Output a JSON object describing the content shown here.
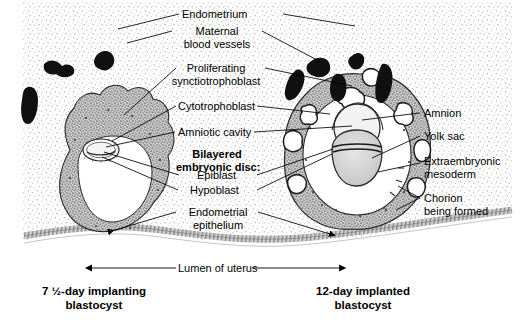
{
  "figure": {
    "title_implied": "Implantation of the blastocyst in the endometrium",
    "background_color": "#ffffff",
    "ink_color": "#000000",
    "stipple_color": "#8c8c8c",
    "trophoblast_fill": "#a8a8a8",
    "vessel_color": "#101010",
    "cavity_fill": "#ffffff",
    "yolk_sac_fill": "#d2d2d2",
    "epithelium_fill": "#b4b4b4"
  },
  "labels": {
    "endometrium": "Endometrium",
    "maternal_blood_vessels_l1": "Maternal",
    "maternal_blood_vessels_l2": "blood vessels",
    "proliferating_l1": "Proliferating",
    "proliferating_l2": "synctiotrophoblast",
    "cytotrophoblast": "Cytotrophoblast",
    "amniotic_cavity": "Amniotic cavity",
    "bilayered_disc_l1": "Bilayered",
    "bilayered_disc_l2": "embryonic disc:",
    "epiblast": "Epiblast",
    "hypoblast": "Hypoblast",
    "endometrial_epithelium_l1": "Endometrial",
    "endometrial_epithelium_l2": "epithelium",
    "amnion": "Amnion",
    "yolk_sac": "Yolk sac",
    "extraembryonic_l1": "Extraembryonic",
    "extraembryonic_l2": "mesoderm",
    "chorion_l1": "Chorion",
    "chorion_l2": "being formed",
    "lumen_of_uterus": "Lumen of uterus"
  },
  "captions": {
    "left_l1": "7 ½-day implanting",
    "left_l2": "blastocyst",
    "right_l1": "12-day implanted",
    "right_l2": "blastocyst"
  },
  "structures": {
    "left_blastocyst": {
      "stage": "7 ½-day implanting",
      "parts": [
        "trophoblast",
        "blastocyst cavity",
        "embryonic disc",
        "endometrium",
        "maternal blood vessels"
      ]
    },
    "right_blastocyst": {
      "stage": "12-day implanted",
      "parts": [
        "syncytiotrophoblast with lacunae",
        "cytotrophoblast",
        "amniotic cavity",
        "yolk sac",
        "bilaminar embryonic disc",
        "extraembryonic mesoderm",
        "chorionic cavity"
      ]
    }
  }
}
